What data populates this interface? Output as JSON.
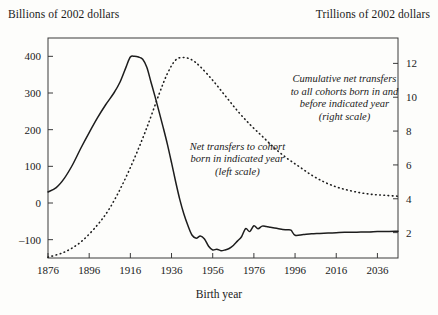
{
  "chart_data": {
    "type": "line",
    "title": "",
    "xlabel": "Birth year",
    "ylabel_left": "Billions of 2002 dollars",
    "ylabel_right": "Trillions of 2002 dollars",
    "grid": false,
    "legend_position": "inline-annotations",
    "xlim": [
      1876,
      2046
    ],
    "xticks": [
      1876,
      1896,
      1916,
      1936,
      1956,
      1976,
      1996,
      2016,
      2036
    ],
    "xtick_labels": [
      "1876",
      "1896",
      "1916",
      "1936",
      "1956",
      "1976",
      "1996",
      "2016",
      "2036"
    ],
    "ylim_left": [
      -150,
      450
    ],
    "yticks_left": [
      -100,
      0,
      100,
      200,
      300,
      400
    ],
    "ytick_labels_left": [
      "–100",
      "0",
      "100",
      "200",
      "300",
      "400"
    ],
    "ylim_right": [
      0.5,
      13.5
    ],
    "yticks_right": [
      2,
      4,
      6,
      8,
      10,
      12
    ],
    "ytick_labels_right": [
      "2",
      "4",
      "6",
      "8",
      "10",
      "12"
    ],
    "annotations": [
      {
        "name": "net-transfers-annotation",
        "lines": [
          "Net transfers to cohort",
          "born in indicated year",
          "(left scale)"
        ],
        "x": 1968,
        "y_left": 145,
        "style": "italic"
      },
      {
        "name": "cumulative-transfers-annotation",
        "lines": [
          "Cumulative net transfers",
          "to all cohorts born in and",
          "before indicated year",
          "(right scale)"
        ],
        "x": 2020,
        "y_left": 330,
        "style": "italic"
      }
    ],
    "series": [
      {
        "name": "Net transfers to cohort born in indicated year",
        "scale": "left",
        "units": "Billions of 2002 dollars",
        "style": "solid",
        "x": [
          1876,
          1880,
          1884,
          1888,
          1892,
          1896,
          1900,
          1904,
          1908,
          1911,
          1914,
          1916,
          1918,
          1920,
          1922,
          1924,
          1926,
          1928,
          1930,
          1932,
          1934,
          1936,
          1938,
          1940,
          1942,
          1944,
          1946,
          1948,
          1950,
          1952,
          1954,
          1956,
          1958,
          1960,
          1962,
          1964,
          1966,
          1968,
          1970,
          1972,
          1974,
          1976,
          1978,
          1980,
          1982,
          1984,
          1986,
          1988,
          1990,
          1992,
          1994,
          1996,
          2000,
          2004,
          2008,
          2012,
          2016,
          2020,
          2024,
          2028,
          2032,
          2036,
          2040,
          2046
        ],
        "y": [
          30,
          42,
          68,
          105,
          150,
          192,
          232,
          268,
          300,
          330,
          372,
          398,
          400,
          398,
          392,
          370,
          330,
          290,
          248,
          205,
          160,
          110,
          58,
          10,
          -30,
          -62,
          -88,
          -96,
          -90,
          -98,
          -118,
          -128,
          -126,
          -130,
          -128,
          -124,
          -116,
          -104,
          -92,
          -70,
          -78,
          -62,
          -70,
          -63,
          -64,
          -66,
          -68,
          -70,
          -72,
          -73,
          -74,
          -88,
          -86,
          -84,
          -83,
          -82,
          -81,
          -80,
          -80,
          -79,
          -79,
          -78,
          -78,
          -77
        ]
      },
      {
        "name": "Cumulative net transfers to all cohorts born in and before indicated year",
        "scale": "right",
        "units": "Trillions of 2002 dollars",
        "style": "dotted",
        "x": [
          1876,
          1884,
          1892,
          1900,
          1906,
          1912,
          1918,
          1924,
          1930,
          1934,
          1938,
          1942,
          1946,
          1950,
          1956,
          1962,
          1968,
          1974,
          1980,
          1986,
          1992,
          1998,
          2004,
          2010,
          2016,
          2022,
          2028,
          2034,
          2040,
          2046
        ],
        "y": [
          0.55,
          0.85,
          1.45,
          2.45,
          3.45,
          4.8,
          6.4,
          8.2,
          10.2,
          11.4,
          12.2,
          12.35,
          12.2,
          11.8,
          11.0,
          10.1,
          9.2,
          8.4,
          7.7,
          7.0,
          6.4,
          5.9,
          5.4,
          5.0,
          4.7,
          4.5,
          4.35,
          4.25,
          4.2,
          4.15
        ]
      }
    ]
  }
}
